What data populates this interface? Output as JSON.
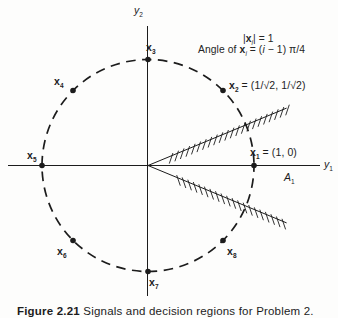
{
  "figure": {
    "ink_color": "#1c1c1c",
    "background_color": "#fdfdfc",
    "axes": {
      "y1_label": [
        {
          "t": "y",
          "i": true
        },
        {
          "t": "1",
          "sub": true
        }
      ],
      "y2_label": [
        {
          "t": "y",
          "i": true
        },
        {
          "t": "2",
          "sub": true
        }
      ]
    },
    "annotation": {
      "line1": [
        {
          "t": "|"
        },
        {
          "t": "x",
          "b": true
        },
        {
          "t": "i",
          "sub": true,
          "i": true
        },
        {
          "t": "| = 1"
        }
      ],
      "line2": [
        {
          "t": "Angle of "
        },
        {
          "t": "x",
          "b": true
        },
        {
          "t": "i",
          "sub": true,
          "i": true
        },
        {
          "t": " = ("
        },
        {
          "t": "i",
          "i": true
        },
        {
          "t": " − 1) π/4"
        }
      ]
    },
    "region_label": [
      {
        "t": "A",
        "i": true
      },
      {
        "t": "1",
        "sub": true
      }
    ],
    "points": [
      {
        "id": "x1",
        "angle_deg": 0,
        "label": [
          {
            "t": "x",
            "b": true
          },
          {
            "t": "1",
            "sub": true,
            "b": true
          },
          {
            "t": " = (1, 0)"
          }
        ]
      },
      {
        "id": "x2",
        "angle_deg": 45,
        "label": [
          {
            "t": "x",
            "b": true
          },
          {
            "t": "2",
            "sub": true,
            "b": true
          },
          {
            "t": " = (1/√2, 1/√2)"
          }
        ]
      },
      {
        "id": "x3",
        "angle_deg": 90,
        "label": [
          {
            "t": "x",
            "b": true
          },
          {
            "t": "3",
            "sub": true,
            "b": true
          }
        ]
      },
      {
        "id": "x4",
        "angle_deg": 135,
        "label": [
          {
            "t": "x",
            "b": true
          },
          {
            "t": "4",
            "sub": true,
            "b": true
          }
        ]
      },
      {
        "id": "x5",
        "angle_deg": 180,
        "label": [
          {
            "t": "x",
            "b": true
          },
          {
            "t": "5",
            "sub": true,
            "b": true
          }
        ]
      },
      {
        "id": "x6",
        "angle_deg": 225,
        "label": [
          {
            "t": "x",
            "b": true
          },
          {
            "t": "6",
            "sub": true,
            "b": true
          }
        ]
      },
      {
        "id": "x7",
        "angle_deg": 270,
        "label": [
          {
            "t": "x",
            "b": true
          },
          {
            "t": "7",
            "sub": true,
            "b": true
          }
        ]
      },
      {
        "id": "x8",
        "angle_deg": 315,
        "label": [
          {
            "t": "x",
            "b": true
          },
          {
            "t": "8",
            "sub": true,
            "b": true
          }
        ]
      }
    ],
    "caption": [
      {
        "t": "Figure 2.21",
        "b": true
      },
      {
        "t": "  Signals and decision regions for Problem 2."
      }
    ]
  }
}
